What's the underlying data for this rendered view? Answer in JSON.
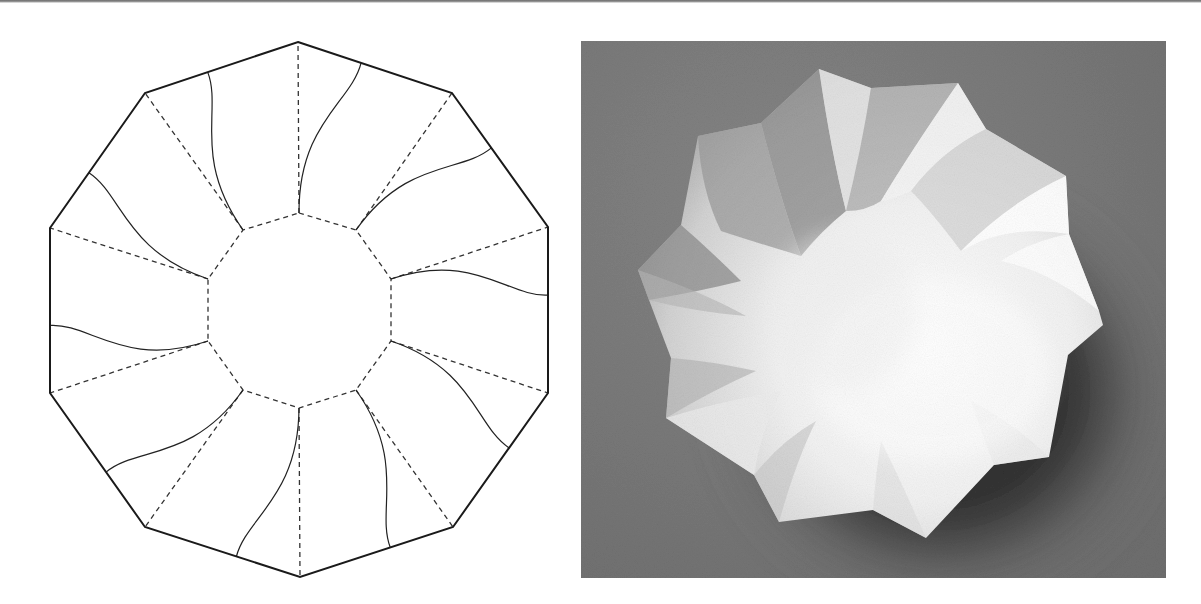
{
  "figure": {
    "left_panel": {
      "kind": "crease-pattern",
      "description": "Decagon crease pattern with inner decagon, dashed radial valley folds and curved mountain folds",
      "center": [
        299.5,
        310
      ],
      "outer_vertices": [
        [
          298,
          42
        ],
        [
          452,
          93
        ],
        [
          548,
          227
        ],
        [
          548,
          393
        ],
        [
          453,
          527
        ],
        [
          300,
          577
        ],
        [
          145,
          527
        ],
        [
          50,
          393
        ],
        [
          50,
          228
        ],
        [
          145,
          93
        ]
      ],
      "inner_vertices": [
        [
          299,
          213
        ],
        [
          356,
          230
        ],
        [
          391,
          279
        ],
        [
          391,
          341
        ],
        [
          356,
          390
        ],
        [
          299,
          408
        ],
        [
          243,
          390
        ],
        [
          208,
          341
        ],
        [
          208,
          279
        ],
        [
          243,
          230
        ]
      ],
      "curve_edge_fraction": 0.41,
      "colors": {
        "outline": "#1a1a1a",
        "dashed": "#333333",
        "curve": "#222222",
        "background": "#ffffff"
      }
    },
    "right_panel": {
      "kind": "photograph",
      "description": "Folded white paper bowl with ten curved petals on gray background",
      "rim_outline": [
        [
          238,
          28
        ],
        [
          290,
          47
        ],
        [
          377,
          42
        ],
        [
          405,
          88
        ],
        [
          485,
          135
        ],
        [
          488,
          193
        ],
        [
          518,
          270
        ],
        [
          522,
          284
        ],
        [
          487,
          314
        ],
        [
          468,
          416
        ],
        [
          413,
          424
        ],
        [
          345,
          497
        ],
        [
          292,
          469
        ],
        [
          198,
          481
        ],
        [
          173,
          434
        ],
        [
          85,
          377
        ],
        [
          90,
          317
        ],
        [
          68,
          259
        ],
        [
          57,
          229
        ],
        [
          100,
          184
        ],
        [
          117,
          95
        ],
        [
          180,
          82
        ]
      ],
      "colors": {
        "background": "#7b7b7b",
        "shadow": "#262626",
        "paper_light": "#f7f7f7",
        "paper_mid": "#cfcfcf",
        "paper_dark": "#8e8e8e"
      }
    }
  }
}
